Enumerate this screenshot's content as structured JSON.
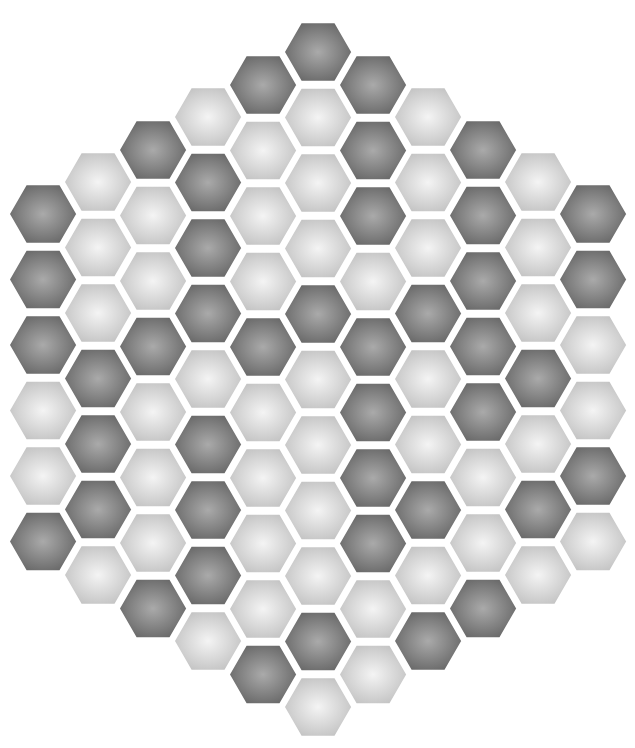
{
  "board": {
    "type": "hex-grid",
    "orientation": "flat-top",
    "columns": 11,
    "total_cells": 91,
    "geometry": {
      "origin_x": 43,
      "col_spacing": 55,
      "row_pitch": 65.5,
      "hex_radius": 36
    },
    "colors": {
      "dark_center": "#aaaaaa",
      "dark_edge": "#676767",
      "light_center": "#f4f4f4",
      "light_edge": "#c2c2c2",
      "gap": "#ffffff"
    },
    "column_data": [
      {
        "col": 0,
        "top_y": 214,
        "cells": [
          "D",
          "D",
          "D",
          "L",
          "L",
          "D"
        ]
      },
      {
        "col": 1,
        "top_y": 182,
        "cells": [
          "L",
          "L",
          "L",
          "D",
          "D",
          "D",
          "L"
        ]
      },
      {
        "col": 2,
        "top_y": 150,
        "cells": [
          "D",
          "L",
          "L",
          "D",
          "L",
          "L",
          "L",
          "D"
        ]
      },
      {
        "col": 3,
        "top_y": 117,
        "cells": [
          "L",
          "D",
          "D",
          "D",
          "L",
          "D",
          "D",
          "D",
          "L"
        ]
      },
      {
        "col": 4,
        "top_y": 85,
        "cells": [
          "D",
          "L",
          "L",
          "L",
          "D",
          "L",
          "L",
          "L",
          "L",
          "D"
        ]
      },
      {
        "col": 5,
        "top_y": 52,
        "cells": [
          "D",
          "L",
          "L",
          "L",
          "D",
          "L",
          "L",
          "L",
          "L",
          "D",
          "L"
        ]
      },
      {
        "col": 6,
        "top_y": 85,
        "cells": [
          "D",
          "D",
          "D",
          "L",
          "D",
          "D",
          "D",
          "D",
          "L",
          "L"
        ]
      },
      {
        "col": 7,
        "top_y": 117,
        "cells": [
          "L",
          "L",
          "L",
          "D",
          "L",
          "L",
          "D",
          "L",
          "D"
        ]
      },
      {
        "col": 8,
        "top_y": 150,
        "cells": [
          "D",
          "D",
          "D",
          "D",
          "D",
          "L",
          "L",
          "D"
        ]
      },
      {
        "col": 9,
        "top_y": 182,
        "cells": [
          "L",
          "L",
          "L",
          "D",
          "L",
          "D",
          "L"
        ]
      },
      {
        "col": 10,
        "top_y": 214,
        "cells": [
          "D",
          "D",
          "L",
          "L",
          "D",
          "L"
        ]
      }
    ]
  }
}
